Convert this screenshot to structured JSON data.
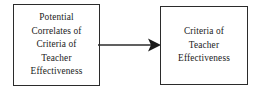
{
  "diagram": {
    "type": "flow-diagram",
    "background_color": "#ffffff",
    "stroke_color": "#2b2b2b",
    "text_color": "#1a1a1a",
    "nodes": [
      {
        "id": "potential-correlates",
        "label": "Potential\nCorrelates of\nCriteria of\nTeacher\nEffectiveness",
        "lines": [
          "Potential",
          "Correlates of",
          "Criteria of",
          "Teacher",
          "Effectiveness"
        ]
      },
      {
        "id": "criteria-teacher-effectiveness",
        "label": "Criteria of\nTeacher\nEffectiveness",
        "lines": [
          "Criteria of",
          "Teacher",
          "Effectiveness"
        ]
      }
    ],
    "edges": [
      {
        "id": "edge-correlates-to-criteria",
        "from": "potential-correlates",
        "to": "criteria-teacher-effectiveness",
        "style": "solid",
        "arrowhead": "filled-triangle",
        "label": ""
      }
    ]
  }
}
